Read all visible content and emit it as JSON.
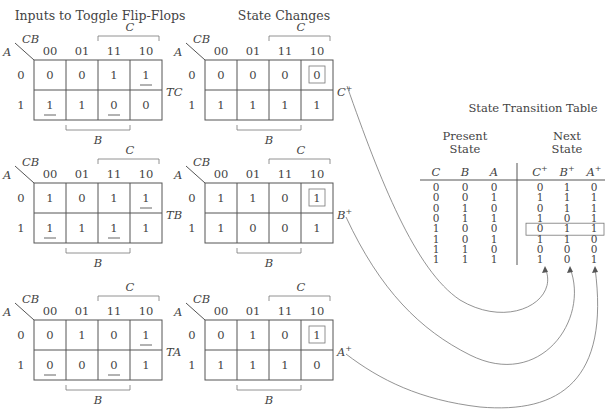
{
  "titles": {
    "left": "Inputs to Toggle Flip-Flops",
    "middle": "State Changes",
    "table": "State Transition Table"
  },
  "kmap_labels": {
    "corner_top": "CB",
    "corner_left": "A",
    "columns": [
      "00",
      "01",
      "11",
      "10"
    ],
    "rows": [
      "0",
      "1"
    ],
    "bracket_top": "C",
    "bracket_bottom": "B"
  },
  "toggle_maps": [
    {
      "name": "TC",
      "cells": [
        [
          "0",
          "0",
          "1",
          "1"
        ],
        [
          "1",
          "1",
          "0",
          "0"
        ]
      ],
      "underlined": [
        [
          false,
          false,
          false,
          true
        ],
        [
          true,
          false,
          true,
          false
        ]
      ]
    },
    {
      "name": "TB",
      "cells": [
        [
          "1",
          "0",
          "1",
          "1"
        ],
        [
          "1",
          "1",
          "1",
          "1"
        ]
      ],
      "underlined": [
        [
          false,
          false,
          false,
          true
        ],
        [
          true,
          false,
          true,
          false
        ]
      ]
    },
    {
      "name": "TA",
      "cells": [
        [
          "0",
          "1",
          "0",
          "1"
        ],
        [
          "0",
          "0",
          "0",
          "1"
        ]
      ],
      "underlined": [
        [
          false,
          false,
          false,
          true
        ],
        [
          true,
          false,
          true,
          false
        ]
      ]
    }
  ],
  "state_maps": [
    {
      "name": "C+",
      "cells": [
        [
          "0",
          "0",
          "0",
          "0"
        ],
        [
          "1",
          "1",
          "1",
          "1"
        ]
      ],
      "boxed_cell": [
        0,
        3
      ]
    },
    {
      "name": "B+",
      "cells": [
        [
          "1",
          "1",
          "0",
          "1"
        ],
        [
          "1",
          "0",
          "0",
          "1"
        ]
      ],
      "boxed_cell": [
        0,
        3
      ]
    },
    {
      "name": "A+",
      "cells": [
        [
          "0",
          "1",
          "0",
          "1"
        ],
        [
          "1",
          "1",
          "1",
          "0"
        ]
      ],
      "boxed_cell": [
        0,
        3
      ]
    }
  ],
  "transition_table": {
    "present_header": [
      "Present",
      "State"
    ],
    "next_header": [
      "Next",
      "State"
    ],
    "columns": [
      "C",
      "B",
      "A",
      "C+",
      "B+",
      "A+"
    ],
    "rows": [
      [
        "0",
        "0",
        "0",
        "0",
        "1",
        "0"
      ],
      [
        "0",
        "0",
        "1",
        "1",
        "1",
        "1"
      ],
      [
        "0",
        "1",
        "0",
        "0",
        "1",
        "1"
      ],
      [
        "0",
        "1",
        "1",
        "1",
        "0",
        "1"
      ],
      [
        "1",
        "0",
        "0",
        "0",
        "1",
        "1"
      ],
      [
        "1",
        "0",
        "1",
        "1",
        "1",
        "0"
      ],
      [
        "1",
        "1",
        "0",
        "0",
        "0",
        "0"
      ],
      [
        "1",
        "1",
        "1",
        "1",
        "0",
        "1"
      ]
    ],
    "highlighted_row": 4
  }
}
